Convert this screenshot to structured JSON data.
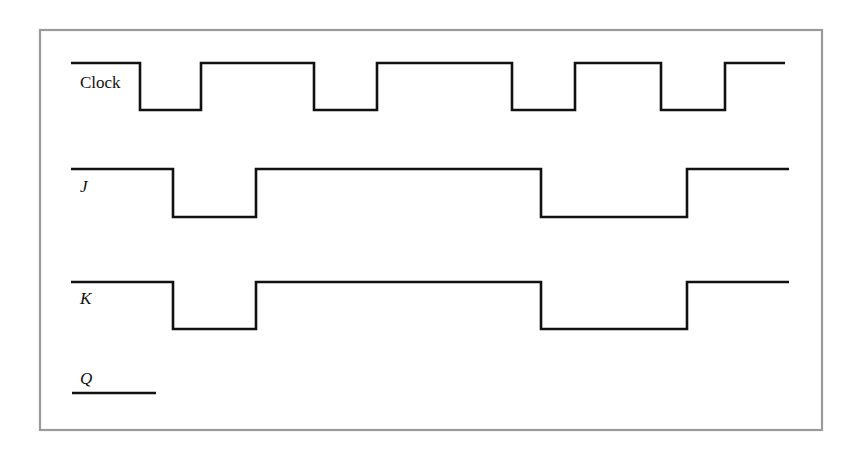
{
  "colors": {
    "frame": "#9a9a9a",
    "waveform": "#111111",
    "background": "#ffffff"
  },
  "frame": {
    "x": 40,
    "y": 30,
    "width": 782,
    "height": 400
  },
  "signals": [
    {
      "id": "clock",
      "label": "Clock",
      "italic": false,
      "label_pos": {
        "x": 80,
        "y": 88
      },
      "high_y": 63,
      "low_y": 110,
      "start_x": 71,
      "end_x": 785,
      "initial_level": "high",
      "transitions_x": [
        140,
        201,
        314,
        377,
        512,
        575,
        661,
        725
      ]
    },
    {
      "id": "j",
      "label": "J",
      "italic": true,
      "label_pos": {
        "x": 80,
        "y": 192
      },
      "high_y": 169,
      "low_y": 217,
      "start_x": 71,
      "end_x": 789,
      "initial_level": "high",
      "transitions_x": [
        173,
        256,
        541,
        687
      ]
    },
    {
      "id": "k",
      "label": "K",
      "italic": true,
      "label_pos": {
        "x": 80,
        "y": 304
      },
      "high_y": 282,
      "low_y": 329,
      "start_x": 71,
      "end_x": 789,
      "initial_level": "high",
      "transitions_x": [
        173,
        256,
        541,
        687
      ]
    },
    {
      "id": "q",
      "label": "Q",
      "italic": true,
      "label_pos": {
        "x": 80,
        "y": 384
      },
      "high_y": 393,
      "low_y": 393,
      "start_x": 72,
      "end_x": 156,
      "initial_level": "low",
      "transitions_x": []
    }
  ]
}
